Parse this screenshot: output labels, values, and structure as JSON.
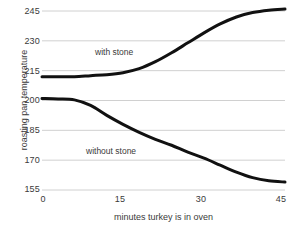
{
  "chart_data": {
    "type": "line",
    "title": "",
    "xlabel": "minutes turkey is in oven",
    "ylabel": "roasting pan temperature",
    "xlim": [
      0,
      45
    ],
    "ylim": [
      155,
      245
    ],
    "grid": true,
    "legend_position": "inline-annotations",
    "x_ticks": [
      "0",
      "15",
      "30",
      "45"
    ],
    "y_ticks": [
      "245",
      "230",
      "215",
      "200",
      "185",
      "170",
      "155"
    ],
    "x": [
      0,
      3,
      6,
      9,
      12,
      15,
      18,
      21,
      24,
      27,
      30,
      33,
      36,
      39,
      42,
      45
    ],
    "series": [
      {
        "name": "with stone",
        "color": "#111111",
        "values": [
          212,
          212,
          212,
          212.5,
          213,
          214,
          216,
          219.5,
          224,
          229,
          234,
          238.5,
          242,
          244.2,
          245.4,
          246
        ]
      },
      {
        "name": "without stone",
        "color": "#111111",
        "values": [
          201,
          200.8,
          200.3,
          197.5,
          192.5,
          188,
          184,
          180.5,
          177.5,
          174,
          171,
          167.5,
          164,
          161.2,
          159.6,
          159
        ]
      }
    ],
    "annotations": [
      {
        "text": "with stone",
        "x": 12,
        "y": 227
      },
      {
        "text": "without stone",
        "x": 11,
        "y": 178
      }
    ]
  }
}
